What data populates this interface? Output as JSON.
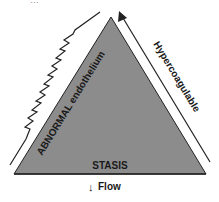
{
  "diagram": {
    "title_cropped": "…",
    "triangle": {
      "fill": "#8c8c8c",
      "stroke": "#222222",
      "left_side_label": "ABNORMAL endothelium",
      "right_side_label": "Hypercoagulable",
      "base_label": "STASIS"
    },
    "below_base": {
      "arrow_glyph": "↓",
      "label": "Flow"
    },
    "left_line": {
      "style": "zigzag",
      "meaning": "abnormal endothelium injury line"
    },
    "right_line": {
      "style": "arrow-up",
      "meaning": "increase"
    }
  }
}
